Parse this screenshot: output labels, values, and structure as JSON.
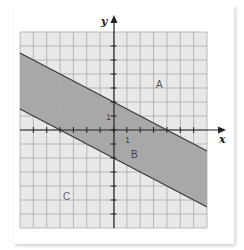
{
  "graph": {
    "axes": {
      "x_label": "x",
      "y_label": "y"
    },
    "x_range": [
      -7,
      7
    ],
    "y_range": [
      -7,
      7
    ],
    "tick_labels": {
      "x_one": "1",
      "y_one": "1"
    },
    "lines": [
      {
        "name": "upper-boundary",
        "slope": -0.5,
        "intercept": 2
      },
      {
        "name": "lower-boundary",
        "slope": -0.5,
        "intercept": -2
      }
    ],
    "regions": [
      {
        "label": "A",
        "description": "above upper line"
      },
      {
        "label": "B",
        "description": "between the lines (shaded darker)"
      },
      {
        "label": "C",
        "description": "below lower line"
      }
    ],
    "colors": {
      "grid_fill": "#e8e8e8",
      "grid_lines": "#a9a9a9",
      "band_fill": "#a8a8a8",
      "boundary": "#3a3a3a",
      "axis": "#222222"
    }
  }
}
